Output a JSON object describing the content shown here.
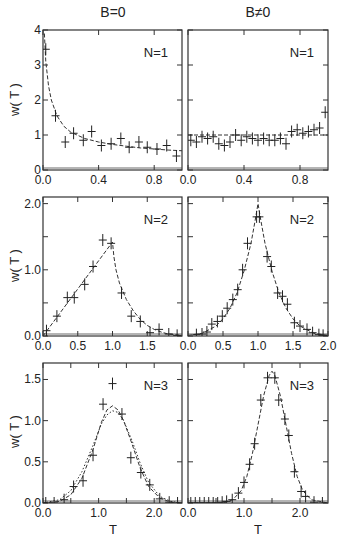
{
  "titles": {
    "left": "B=0",
    "right": "B≠0"
  },
  "axis_labels": {
    "y": "w( T )",
    "x": "T"
  },
  "chart_data": [
    {
      "type": "scatter",
      "panel": "row1-left",
      "column_title": "B=0",
      "annotation": "N=1",
      "xlabel": "",
      "ylabel": "w( T )",
      "xlim": [
        0.0,
        1.0
      ],
      "ylim": [
        0,
        4
      ],
      "xticks": [
        0.0,
        0.4,
        0.8
      ],
      "xtick_labels": [
        "0.0",
        "0.4",
        "0.8"
      ],
      "yticks": [
        0,
        1,
        2,
        3,
        4
      ],
      "ytick_labels": [
        "0",
        "1",
        "2",
        "3",
        "4"
      ],
      "points": [
        [
          0.02,
          3.45
        ],
        [
          0.09,
          1.55
        ],
        [
          0.16,
          0.8
        ],
        [
          0.22,
          1.05
        ],
        [
          0.29,
          0.85
        ],
        [
          0.35,
          1.1
        ],
        [
          0.42,
          0.7
        ],
        [
          0.49,
          0.75
        ],
        [
          0.56,
          0.9
        ],
        [
          0.62,
          0.65
        ],
        [
          0.69,
          0.8
        ],
        [
          0.75,
          0.65
        ],
        [
          0.82,
          0.6
        ],
        [
          0.89,
          0.7
        ],
        [
          0.96,
          0.4
        ]
      ],
      "fit_curve": "dashed, ~0.6/sqrt(T) decay",
      "fit": [
        [
          0.01,
          3.9
        ],
        [
          0.02,
          3.1
        ],
        [
          0.04,
          2.4
        ],
        [
          0.06,
          2.0
        ],
        [
          0.1,
          1.55
        ],
        [
          0.15,
          1.25
        ],
        [
          0.2,
          1.08
        ],
        [
          0.3,
          0.9
        ],
        [
          0.4,
          0.8
        ],
        [
          0.5,
          0.73
        ],
        [
          0.6,
          0.68
        ],
        [
          0.7,
          0.63
        ],
        [
          0.8,
          0.6
        ],
        [
          0.9,
          0.57
        ],
        [
          1.0,
          0.55
        ]
      ]
    },
    {
      "type": "scatter",
      "panel": "row1-right",
      "column_title": "B≠0",
      "annotation": "N=1",
      "xlim": [
        0.0,
        1.0
      ],
      "ylim": [
        0,
        4
      ],
      "xticks": [
        0.0,
        0.4,
        0.8
      ],
      "xtick_labels": [
        "0.0",
        "0.4",
        "0.8"
      ],
      "yticks": [
        0,
        1,
        2,
        3,
        4
      ],
      "ytick_labels": [],
      "points": [
        [
          0.02,
          0.85
        ],
        [
          0.06,
          0.8
        ],
        [
          0.1,
          0.95
        ],
        [
          0.14,
          0.9
        ],
        [
          0.18,
          0.95
        ],
        [
          0.22,
          0.75
        ],
        [
          0.26,
          0.7
        ],
        [
          0.3,
          0.8
        ],
        [
          0.34,
          1.0
        ],
        [
          0.38,
          0.85
        ],
        [
          0.42,
          0.95
        ],
        [
          0.46,
          0.9
        ],
        [
          0.5,
          0.85
        ],
        [
          0.54,
          0.9
        ],
        [
          0.58,
          0.85
        ],
        [
          0.62,
          0.85
        ],
        [
          0.66,
          0.9
        ],
        [
          0.7,
          0.75
        ],
        [
          0.74,
          1.1
        ],
        [
          0.78,
          1.15
        ],
        [
          0.82,
          1.05
        ],
        [
          0.86,
          1.1
        ],
        [
          0.9,
          1.15
        ],
        [
          0.94,
          1.2
        ],
        [
          0.98,
          1.65
        ]
      ],
      "fit_curve": "dashed, constant ~1.0",
      "fit": [
        [
          0.0,
          1.0
        ],
        [
          1.0,
          1.0
        ]
      ]
    },
    {
      "type": "scatter",
      "panel": "row2-left",
      "annotation": "N=2",
      "ylabel": "w( T )",
      "xlim": [
        0.0,
        2.0
      ],
      "ylim": [
        0.0,
        2.1
      ],
      "xticks": [
        0.0,
        0.5,
        1.0,
        1.5
      ],
      "xtick_labels": [
        "0.0",
        "0.5",
        "1.0",
        "1.5"
      ],
      "yticks": [
        0.0,
        0.5,
        1.0,
        1.5,
        2.0
      ],
      "ytick_labels": [
        "0.0",
        "",
        "1.0",
        "",
        "2.0"
      ],
      "points": [
        [
          0.05,
          0.08
        ],
        [
          0.2,
          0.3
        ],
        [
          0.35,
          0.58
        ],
        [
          0.45,
          0.58
        ],
        [
          0.6,
          0.78
        ],
        [
          0.72,
          1.05
        ],
        [
          0.86,
          1.45
        ],
        [
          0.98,
          1.4
        ],
        [
          1.13,
          0.65
        ],
        [
          1.27,
          0.3
        ],
        [
          1.4,
          0.22
        ],
        [
          1.54,
          0.05
        ],
        [
          1.67,
          0.1
        ],
        [
          1.81,
          0.03
        ],
        [
          1.93,
          0.01
        ]
      ],
      "fit_curve": "dashed, linear rise to peak at T=1.0 then decay",
      "fit": [
        [
          0.0,
          0.0
        ],
        [
          1.0,
          1.42
        ],
        [
          1.02,
          1.2
        ],
        [
          1.05,
          1.0
        ],
        [
          1.1,
          0.8
        ],
        [
          1.2,
          0.55
        ],
        [
          1.3,
          0.38
        ],
        [
          1.4,
          0.25
        ],
        [
          1.5,
          0.16
        ],
        [
          1.6,
          0.1
        ],
        [
          1.7,
          0.06
        ],
        [
          1.8,
          0.03
        ],
        [
          2.0,
          0.01
        ]
      ]
    },
    {
      "type": "scatter",
      "panel": "row2-right",
      "annotation": "N=2",
      "xlim": [
        0.0,
        2.0
      ],
      "ylim": [
        0.0,
        2.1
      ],
      "xticks": [
        0.0,
        0.5,
        1.0,
        1.5,
        2.0
      ],
      "xtick_labels": [
        "0.0",
        "0.5",
        "1.0",
        "1.5",
        "2.0"
      ],
      "yticks": [
        0.0,
        0.5,
        1.0,
        1.5,
        2.0
      ],
      "ytick_labels": [],
      "points": [
        [
          0.12,
          0.02
        ],
        [
          0.2,
          0.03
        ],
        [
          0.27,
          0.06
        ],
        [
          0.34,
          0.18
        ],
        [
          0.42,
          0.22
        ],
        [
          0.49,
          0.3
        ],
        [
          0.56,
          0.42
        ],
        [
          0.64,
          0.55
        ],
        [
          0.71,
          0.7
        ],
        [
          0.78,
          1.0
        ],
        [
          0.85,
          1.4
        ],
        [
          0.98,
          1.8
        ],
        [
          1.02,
          1.8
        ],
        [
          1.13,
          1.2
        ],
        [
          1.19,
          1.05
        ],
        [
          1.28,
          0.65
        ],
        [
          1.35,
          0.6
        ],
        [
          1.42,
          0.48
        ],
        [
          1.52,
          0.2
        ],
        [
          1.6,
          0.15
        ],
        [
          1.7,
          0.1
        ],
        [
          1.78,
          0.05
        ],
        [
          1.87,
          0.02
        ],
        [
          1.93,
          0.01
        ]
      ],
      "fit_curve": "dashed, cusp peak at T=1.0 (~2.0)",
      "fit": [
        [
          0.0,
          0.01
        ],
        [
          0.2,
          0.04
        ],
        [
          0.4,
          0.15
        ],
        [
          0.5,
          0.26
        ],
        [
          0.6,
          0.42
        ],
        [
          0.7,
          0.65
        ],
        [
          0.8,
          0.98
        ],
        [
          0.9,
          1.4
        ],
        [
          0.96,
          1.75
        ],
        [
          1.0,
          2.0
        ],
        [
          1.04,
          1.75
        ],
        [
          1.1,
          1.4
        ],
        [
          1.2,
          0.98
        ],
        [
          1.3,
          0.65
        ],
        [
          1.4,
          0.42
        ],
        [
          1.5,
          0.26
        ],
        [
          1.6,
          0.15
        ],
        [
          1.8,
          0.04
        ],
        [
          2.0,
          0.01
        ]
      ]
    },
    {
      "type": "scatter",
      "panel": "row3-left",
      "annotation": "N=3",
      "xlabel": "T",
      "ylabel": "w( T )",
      "xlim": [
        0.0,
        2.5
      ],
      "ylim": [
        0.0,
        1.7
      ],
      "xticks": [
        0.0,
        0.5,
        1.0,
        1.5,
        2.0
      ],
      "xtick_labels": [
        "0.0",
        "",
        "1.0",
        "",
        "2.0"
      ],
      "yticks": [
        0.0,
        0.5,
        1.0,
        1.5
      ],
      "ytick_labels": [
        "0.0",
        "0.5",
        "1.0",
        "1.5"
      ],
      "points": [
        [
          0.05,
          0.0
        ],
        [
          0.2,
          0.0
        ],
        [
          0.38,
          0.04
        ],
        [
          0.55,
          0.2
        ],
        [
          0.72,
          0.27
        ],
        [
          0.9,
          0.58
        ],
        [
          1.08,
          1.2
        ],
        [
          1.25,
          1.45
        ],
        [
          1.42,
          1.08
        ],
        [
          1.58,
          0.55
        ],
        [
          1.76,
          0.37
        ],
        [
          1.92,
          0.22
        ],
        [
          2.1,
          0.05
        ],
        [
          2.27,
          0.01
        ],
        [
          2.42,
          0.0
        ]
      ],
      "fit_curve": "dashed and dotted Gaussian-like curves peaking near T≈1.25 (~1.18 and ~1.12)",
      "fit": [
        [
          0.0,
          0.0
        ],
        [
          0.3,
          0.02
        ],
        [
          0.5,
          0.1
        ],
        [
          0.7,
          0.3
        ],
        [
          0.9,
          0.65
        ],
        [
          1.05,
          0.98
        ],
        [
          1.15,
          1.13
        ],
        [
          1.25,
          1.18
        ],
        [
          1.35,
          1.13
        ],
        [
          1.45,
          1.0
        ],
        [
          1.6,
          0.72
        ],
        [
          1.75,
          0.42
        ],
        [
          1.9,
          0.2
        ],
        [
          2.1,
          0.06
        ],
        [
          2.3,
          0.01
        ],
        [
          2.5,
          0.0
        ]
      ],
      "fit2": [
        [
          0.0,
          0.0
        ],
        [
          0.3,
          0.04
        ],
        [
          0.5,
          0.15
        ],
        [
          0.7,
          0.38
        ],
        [
          0.9,
          0.7
        ],
        [
          1.05,
          0.96
        ],
        [
          1.15,
          1.07
        ],
        [
          1.25,
          1.12
        ],
        [
          1.35,
          1.1
        ],
        [
          1.45,
          1.0
        ],
        [
          1.6,
          0.76
        ],
        [
          1.75,
          0.48
        ],
        [
          1.9,
          0.25
        ],
        [
          2.1,
          0.08
        ],
        [
          2.3,
          0.02
        ],
        [
          2.5,
          0.0
        ]
      ]
    },
    {
      "type": "scatter",
      "panel": "row3-right",
      "annotation": "N=3",
      "xlabel": "T",
      "xlim": [
        0.0,
        2.5
      ],
      "ylim": [
        0.0,
        1.7
      ],
      "xticks": [
        0.0,
        0.5,
        1.0,
        1.5,
        2.0
      ],
      "xtick_labels": [
        "0.0",
        "",
        "1.0",
        "",
        "2.0"
      ],
      "yticks": [
        0.0,
        0.5,
        1.0,
        1.5
      ],
      "ytick_labels": [],
      "points": [
        [
          0.05,
          0.0
        ],
        [
          0.13,
          0.0
        ],
        [
          0.21,
          0.0
        ],
        [
          0.29,
          0.0
        ],
        [
          0.37,
          0.0
        ],
        [
          0.45,
          0.0
        ],
        [
          0.53,
          0.0
        ],
        [
          0.61,
          0.01
        ],
        [
          0.69,
          0.02
        ],
        [
          0.79,
          0.04
        ],
        [
          0.9,
          0.12
        ],
        [
          1.0,
          0.25
        ],
        [
          1.1,
          0.47
        ],
        [
          1.19,
          0.72
        ],
        [
          1.3,
          1.25
        ],
        [
          1.42,
          1.52
        ],
        [
          1.55,
          1.52
        ],
        [
          1.62,
          1.25
        ],
        [
          1.73,
          1.02
        ],
        [
          1.8,
          0.82
        ],
        [
          1.9,
          0.38
        ],
        [
          2.02,
          0.14
        ],
        [
          2.1,
          0.08
        ],
        [
          2.25,
          0.01
        ],
        [
          2.4,
          0.0
        ]
      ],
      "fit_curve": "dashed, Gaussian peak near T≈1.5 (~1.6)",
      "fit": [
        [
          0.0,
          0.0
        ],
        [
          0.6,
          0.0
        ],
        [
          0.8,
          0.04
        ],
        [
          0.95,
          0.15
        ],
        [
          1.05,
          0.32
        ],
        [
          1.15,
          0.6
        ],
        [
          1.25,
          0.95
        ],
        [
          1.35,
          1.3
        ],
        [
          1.45,
          1.55
        ],
        [
          1.5,
          1.6
        ],
        [
          1.55,
          1.55
        ],
        [
          1.65,
          1.3
        ],
        [
          1.75,
          0.95
        ],
        [
          1.85,
          0.6
        ],
        [
          1.95,
          0.32
        ],
        [
          2.05,
          0.15
        ],
        [
          2.2,
          0.04
        ],
        [
          2.5,
          0.0
        ]
      ]
    }
  ]
}
